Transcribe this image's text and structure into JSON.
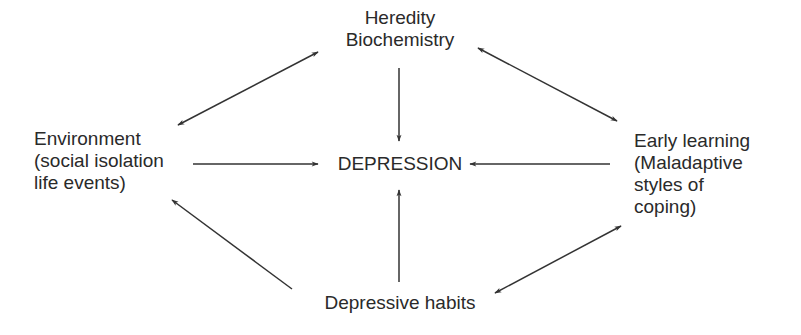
{
  "diagram": {
    "type": "causal-model",
    "colors": {
      "text": "#2a2a2a",
      "arrow": "#333333",
      "background": "#ffffff"
    },
    "nodes": {
      "top": {
        "lines": [
          "Heredity",
          "Biochemistry"
        ]
      },
      "center": {
        "lines": [
          "DEPRESSION"
        ]
      },
      "left": {
        "lines": [
          "Environment",
          "(social isolation",
          "life events)"
        ]
      },
      "right": {
        "lines": [
          "Early learning",
          "(Maladaptive",
          "styles of",
          "coping)"
        ]
      },
      "bottom": {
        "lines": [
          "Depressive habits"
        ]
      }
    },
    "edges": [
      {
        "from": "top",
        "to": "center",
        "direction": "one-way"
      },
      {
        "from": "left",
        "to": "center",
        "direction": "one-way"
      },
      {
        "from": "right",
        "to": "center",
        "direction": "one-way"
      },
      {
        "from": "bottom",
        "to": "center",
        "direction": "one-way"
      },
      {
        "from": "top",
        "to": "left",
        "direction": "two-way"
      },
      {
        "from": "top",
        "to": "right",
        "direction": "two-way"
      },
      {
        "from": "bottom",
        "to": "left",
        "direction": "one-way"
      },
      {
        "from": "bottom",
        "to": "right",
        "direction": "two-way"
      }
    ]
  }
}
